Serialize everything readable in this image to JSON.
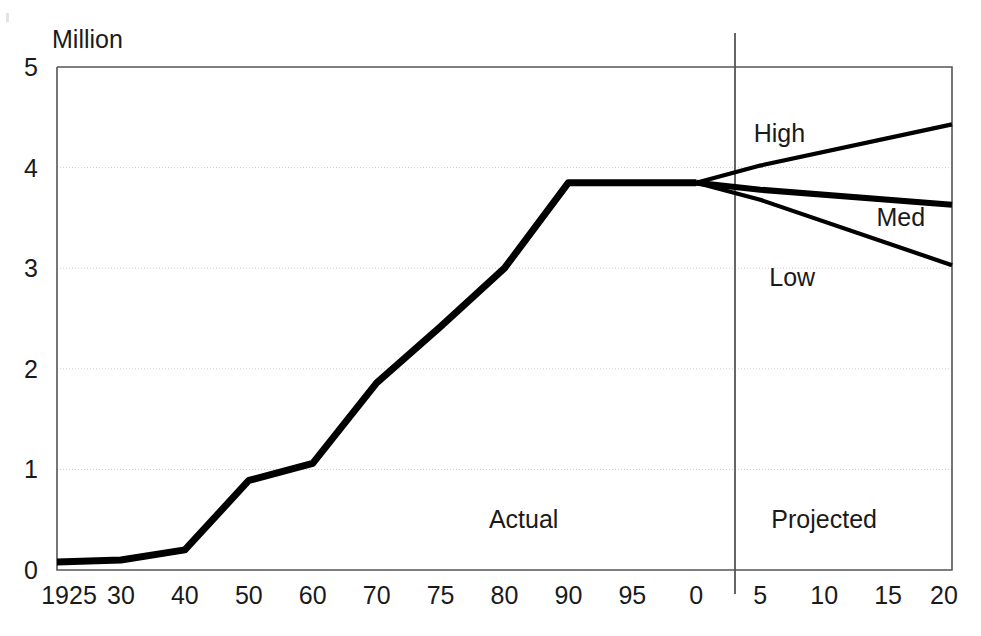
{
  "chart_data": {
    "type": "line",
    "title": "",
    "subtitle": "",
    "xlabel": "",
    "ylabel": "",
    "unit_label": "Million",
    "ylim": [
      0,
      5
    ],
    "yticks": [
      0,
      1,
      2,
      3,
      4,
      5
    ],
    "ytick_labels": [
      "0",
      "1",
      "2",
      "3",
      "4",
      "5"
    ],
    "xtick_labels": [
      "1925",
      "30",
      "40",
      "50",
      "60",
      "70",
      "75",
      "80",
      "90",
      "95",
      "0",
      "5",
      "10",
      "15",
      "20"
    ],
    "xtick_years": [
      1925,
      1930,
      1940,
      1950,
      1960,
      1970,
      1975,
      1980,
      1990,
      1995,
      2000,
      2005,
      2010,
      2015,
      2020
    ],
    "grid": "horizontal-dotted",
    "legend_position": "inline-annotations",
    "divider_year": 2000,
    "region_labels": [
      {
        "text": "Actual",
        "year": 1983,
        "value": 0.42
      },
      {
        "text": "Projected",
        "year": 2010,
        "value": 0.42
      }
    ],
    "annotations": [
      {
        "text": "High",
        "year": 2006.5,
        "value": 4.25
      },
      {
        "text": "Med",
        "year": 2016,
        "value": 3.42
      },
      {
        "text": "Low",
        "year": 2007.5,
        "value": 2.82
      }
    ],
    "series": [
      {
        "name": "Actual",
        "x": [
          1925,
          1930,
          1940,
          1950,
          1960,
          1970,
          1975,
          1980,
          1990,
          1995,
          2000
        ],
        "values": [
          0.08,
          0.1,
          0.2,
          0.89,
          1.06,
          1.86,
          2.42,
          3.0,
          3.85,
          3.85,
          3.85
        ]
      },
      {
        "name": "High",
        "x": [
          2000,
          2005,
          2020
        ],
        "values": [
          3.85,
          4.02,
          4.43
        ]
      },
      {
        "name": "Med",
        "x": [
          2000,
          2005,
          2020
        ],
        "values": [
          3.85,
          3.78,
          3.63
        ]
      },
      {
        "name": "Low",
        "x": [
          2000,
          2005,
          2020
        ],
        "values": [
          3.85,
          3.68,
          3.03
        ]
      }
    ]
  },
  "axes": {
    "unit": "Million",
    "y_ticks": [
      "0",
      "1",
      "2",
      "3",
      "4",
      "5"
    ],
    "x_ticks": [
      "1925",
      "30",
      "40",
      "50",
      "60",
      "70",
      "75",
      "80",
      "90",
      "95",
      "0",
      "5",
      "10",
      "15",
      "20"
    ]
  },
  "labels": {
    "high": "High",
    "med": "Med",
    "low": "Low",
    "actual": "Actual",
    "projected": "Projected"
  },
  "colors": {
    "line": "#000000",
    "axis": "#555555",
    "grid": "#cccccc",
    "background": "#ffffff",
    "text": "#1a1a1a"
  }
}
